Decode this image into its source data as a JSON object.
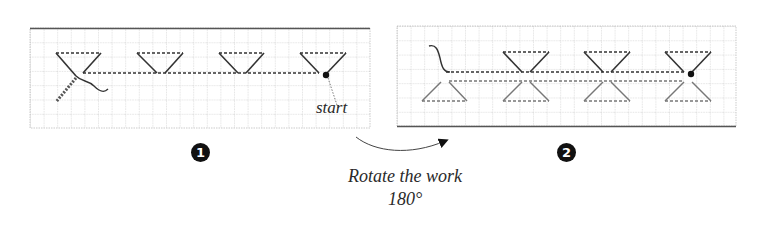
{
  "steps": [
    {
      "number": "1",
      "label": "start"
    },
    {
      "number": "2"
    }
  ],
  "instruction": {
    "line1": "Rotate the work",
    "line2": "180°"
  },
  "colors": {
    "grid": "#9a9a9a",
    "stitch": "#333333",
    "stitch_secondary": "#777777",
    "border": "#555555"
  }
}
